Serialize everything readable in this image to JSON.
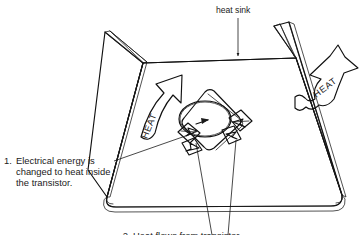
{
  "figure": {
    "title_label": "heat sink",
    "background_color": "#ffffff",
    "ink_color": "#111111",
    "surface_fill": "#e9e9e9",
    "stipple_color": "#b8b8b8"
  },
  "labels": {
    "heat_sink": "heat sink",
    "heat_left": "HEAT",
    "heat_right": "HEAT",
    "step_number": "1.",
    "step_line1": "Electrical energy is",
    "step_line2": "changed to heat inside",
    "step_line3": "the transistor.",
    "bottom_caption": "2. Heat flows from transistor"
  },
  "callouts": [
    {
      "id": "heat-sink-callout",
      "text": "heat sink",
      "pointer": "down-arrow-to-back-edge"
    },
    {
      "id": "step-1-callout",
      "text": "1. Electrical energy is changed to heat inside the transistor.",
      "pointer": "leader-line-to-transistor"
    }
  ],
  "elements": {
    "heat_sink_name": "heat-sink-channel",
    "transistor_name": "power-transistor",
    "arrow_left_name": "heat-arrow-left",
    "arrow_right_name": "heat-arrow-right",
    "conduction_arrows_name": "conduction-arrows"
  }
}
